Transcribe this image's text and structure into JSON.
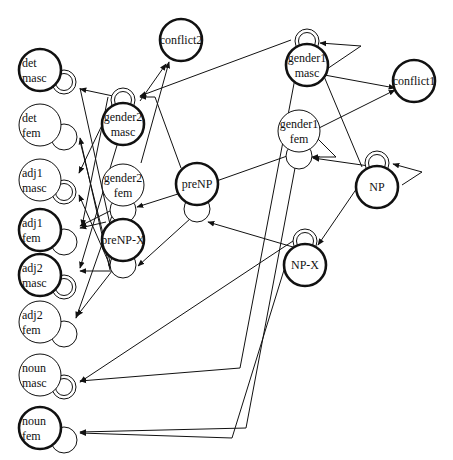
{
  "diagram": {
    "type": "network-diagram",
    "nodes": [
      {
        "id": "det_masc",
        "line1": "det",
        "line2": "masc",
        "cx": 40,
        "cy": 70,
        "border": "thick",
        "loop": "double",
        "loop_pos": "right"
      },
      {
        "id": "det_fem",
        "line1": "det",
        "line2": "fem",
        "cx": 40,
        "cy": 125,
        "border": "thin",
        "loop": "single",
        "loop_pos": "right"
      },
      {
        "id": "adj1_masc",
        "line1": "adj1",
        "line2": "masc",
        "cx": 40,
        "cy": 180,
        "border": "thin",
        "loop": "double",
        "loop_pos": "right"
      },
      {
        "id": "adj1_fem",
        "line1": "adj1",
        "line2": "fem",
        "cx": 40,
        "cy": 230,
        "border": "thick",
        "loop": "single",
        "loop_pos": "right"
      },
      {
        "id": "adj2_masc",
        "line1": "adj2",
        "line2": "masc",
        "cx": 40,
        "cy": 275,
        "border": "thick",
        "loop": "double",
        "loop_pos": "right"
      },
      {
        "id": "adj2_fem",
        "line1": "adj2",
        "line2": "fem",
        "cx": 40,
        "cy": 322,
        "border": "thin",
        "loop": "single",
        "loop_pos": "right"
      },
      {
        "id": "noun_masc",
        "line1": "noun",
        "line2": "masc",
        "cx": 40,
        "cy": 375,
        "border": "thin",
        "loop": "double",
        "loop_pos": "right"
      },
      {
        "id": "noun_fem",
        "line1": "noun",
        "line2": "fem",
        "cx": 40,
        "cy": 428,
        "border": "thick",
        "loop": "single",
        "loop_pos": "right"
      },
      {
        "id": "gender2_masc",
        "line1": "gender2",
        "line2": "masc",
        "cx": 123,
        "cy": 124,
        "border": "thick",
        "loop": "double",
        "loop_pos": "top"
      },
      {
        "id": "gender2_fem",
        "line1": "gender2",
        "line2": "fem",
        "cx": 123,
        "cy": 185,
        "border": "thin",
        "loop": "single",
        "loop_pos": "bottom"
      },
      {
        "id": "preNP_X",
        "line1": "preNP-X",
        "line2": "",
        "cx": 123,
        "cy": 240,
        "border": "thick",
        "loop": "single",
        "loop_pos": "bottom"
      },
      {
        "id": "conflict2",
        "line1": "conflict2",
        "line2": "",
        "cx": 181,
        "cy": 40,
        "border": "thick",
        "loop": "none"
      },
      {
        "id": "preNP",
        "line1": "preNP",
        "line2": "",
        "cx": 197,
        "cy": 184,
        "border": "thick",
        "loop": "single",
        "loop_pos": "bottom"
      },
      {
        "id": "gender1_masc",
        "line1": "gender1",
        "line2": "masc",
        "cx": 307,
        "cy": 65,
        "border": "thick",
        "loop": "double",
        "loop_pos": "top"
      },
      {
        "id": "gender1_fem",
        "line1": "gender1",
        "line2": "fem",
        "cx": 299,
        "cy": 131,
        "border": "thin",
        "loop": "single",
        "loop_pos": "bottom"
      },
      {
        "id": "conflict1",
        "line1": "conflict1",
        "line2": "",
        "cx": 414,
        "cy": 81,
        "border": "thick",
        "loop": "none"
      },
      {
        "id": "NP",
        "line1": "NP",
        "line2": "",
        "cx": 377,
        "cy": 187,
        "border": "thick",
        "loop": "double",
        "loop_pos": "top"
      },
      {
        "id": "NP_X",
        "line1": "NP-X",
        "line2": "",
        "cx": 305,
        "cy": 265,
        "border": "thick",
        "loop": "double",
        "loop_pos": "top"
      }
    ],
    "edges": [
      {
        "from": "gender2_masc",
        "to": "det_masc",
        "d": "M113,96 L80,89"
      },
      {
        "from": "gender2_masc",
        "to": "adj1_masc",
        "d": "M116,96 L79,173"
      },
      {
        "from": "gender2_masc",
        "to": "conflict2",
        "d": "M140,101 L166,64"
      },
      {
        "from": "gender2_fem",
        "to": "conflict2",
        "d": "M141,163 L169,62"
      },
      {
        "from": "gender1_masc",
        "to": "gender2_masc",
        "d": "M291,40 L140,96"
      },
      {
        "from": "preNP",
        "to": "gender2_masc",
        "d": "M181,168 L155,97 L140,97"
      },
      {
        "from": "det_masc",
        "to": "adj2_fem",
        "d": "M80,88 L120,270"
      },
      {
        "from": "det_fem",
        "to": "noun_masc",
        "d": "M80,141 L112,270"
      },
      {
        "from": "preNP_X",
        "to": "det_fem",
        "d": "M110,270 L80,138"
      },
      {
        "from": "preNP_X",
        "to": "adj1_masc",
        "d": "M112,270 L79,195"
      },
      {
        "from": "preNP_X",
        "to": "adj1_fem",
        "d": "M106,222 L80,228"
      },
      {
        "from": "preNP_X",
        "to": "adj2_masc",
        "d": "M112,271 L80,271"
      },
      {
        "from": "preNP_X",
        "to": "adj2_fem",
        "d": "M112,271 L77,316"
      },
      {
        "from": "gender2_fem",
        "to": "adj1_fem",
        "d": "M112,210 L80,226"
      },
      {
        "from": "gender2_fem",
        "to": "adj2_fem",
        "d": "M114,210 L76,318"
      },
      {
        "from": "preNP",
        "to": "gender2_fem",
        "d": "M181,193 L137,207"
      },
      {
        "from": "gender1_fem",
        "to": "preNP",
        "d": "M290,155 L208,184"
      },
      {
        "from": "preNP",
        "to": "preNP_X",
        "d": "M191,218 L138,266"
      },
      {
        "from": "NP_X",
        "to": "preNP",
        "d": "M293,247 L208,222"
      },
      {
        "from": "NP",
        "to": "gender1_fem",
        "d": "M369,166 L313,158"
      },
      {
        "from": "NP",
        "to": "NP_X",
        "d": "M370,169 L318,245"
      },
      {
        "from": "NP",
        "to": "gender1_masc",
        "d": "M362,167 L318,62"
      },
      {
        "from": "gender1_masc",
        "to": "conflict1",
        "d": "M319,74 L395,88"
      },
      {
        "from": "gender1_fem",
        "to": "conflict1",
        "d": "M317,129 L395,90"
      },
      {
        "from": "gender1_fem",
        "to": "gender1_fem",
        "d": "M318,139 L336,157 L312,157"
      },
      {
        "from": "NP",
        "to": "NP",
        "d": "M402,185 L422,172 L393,164"
      },
      {
        "from": "gender1_masc",
        "to": "gender1_masc",
        "d": "M324,71 L361,46 L320,43"
      },
      {
        "from": "gender1_masc",
        "to": "noun_masc",
        "d": "M296,73 L240,368 L80,381"
      },
      {
        "from": "gender1_fem",
        "to": "noun_fem",
        "d": "M295,168 L246,428 L80,432"
      },
      {
        "from": "NP_X",
        "to": "noun_masc",
        "d": "M293,241 L80,382"
      },
      {
        "from": "NP_X",
        "to": "noun_fem",
        "d": "M284,270 L232,438 L80,433"
      },
      {
        "from": "gender2_masc",
        "to": "adj2_masc",
        "d": "M118,142 L80,268"
      },
      {
        "from": "gender2_masc",
        "to": "adj1_fem",
        "d": "M108,97 L82,226"
      }
    ]
  }
}
